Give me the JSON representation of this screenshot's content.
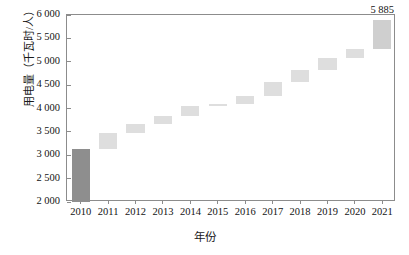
{
  "chart_data": {
    "type": "bar",
    "subtype": "waterfall",
    "title": "",
    "subtitle": "",
    "xlabel": "年份",
    "ylabel": "用电量（千瓦时/人）",
    "categories": [
      "2010",
      "2011",
      "2012",
      "2013",
      "2014",
      "2015",
      "2016",
      "2017",
      "2018",
      "2019",
      "2020",
      "2021"
    ],
    "values": [
      3130,
      3470,
      3670,
      3840,
      4060,
      4090,
      4260,
      4560,
      4830,
      5090,
      5280,
      5885
    ],
    "series": [
      {
        "name": "用电量（千瓦时/人）",
        "values": [
          3130,
          3470,
          3670,
          3840,
          4060,
          4090,
          4260,
          4560,
          4830,
          5090,
          5280,
          5885
        ]
      }
    ],
    "waterfall_segments": [
      {
        "category": "2010",
        "start": 2000,
        "end": 3130,
        "kind": "base"
      },
      {
        "category": "2011",
        "start": 3130,
        "end": 3470,
        "kind": "increase"
      },
      {
        "category": "2012",
        "start": 3470,
        "end": 3670,
        "kind": "increase"
      },
      {
        "category": "2013",
        "start": 3670,
        "end": 3840,
        "kind": "increase"
      },
      {
        "category": "2014",
        "start": 3840,
        "end": 4060,
        "kind": "increase"
      },
      {
        "category": "2015",
        "start": 4060,
        "end": 4090,
        "kind": "increase"
      },
      {
        "category": "2016",
        "start": 4090,
        "end": 4260,
        "kind": "increase"
      },
      {
        "category": "2017",
        "start": 4260,
        "end": 4560,
        "kind": "increase"
      },
      {
        "category": "2018",
        "start": 4560,
        "end": 4830,
        "kind": "increase"
      },
      {
        "category": "2019",
        "start": 4830,
        "end": 5090,
        "kind": "increase"
      },
      {
        "category": "2020",
        "start": 5090,
        "end": 5280,
        "kind": "increase"
      },
      {
        "category": "2021",
        "start": 5280,
        "end": 5885,
        "kind": "increase"
      }
    ],
    "ylim": [
      2000,
      6000
    ],
    "yticks": [
      2000,
      2500,
      3000,
      3500,
      4000,
      4500,
      5000,
      5500,
      6000
    ],
    "ytick_labels": [
      "2 000",
      "2 500",
      "3 000",
      "3 500",
      "4 000",
      "4 500",
      "5 000",
      "5 500",
      "6 000"
    ],
    "grid": false,
    "legend": null,
    "annotations": [
      {
        "text": "5 885",
        "category": "2021",
        "value": 5885,
        "position": "above-bar"
      }
    ],
    "colors": {
      "base_bar": "#8e8e8e",
      "step_bar": "#dedede",
      "last_bar": "#cfcfcf",
      "axis": "#8c8c8c",
      "text": "#141414",
      "background": "#ffffff"
    }
  }
}
